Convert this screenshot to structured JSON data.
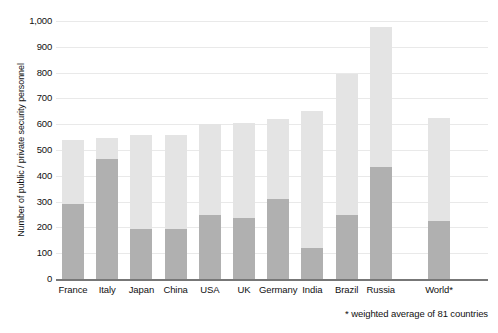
{
  "chart_data": {
    "type": "bar",
    "subtype": "stacked-bar",
    "title": "",
    "xlabel": "",
    "ylabel": "Number of public / private security personnel",
    "ylim": [
      0,
      1000
    ],
    "yticks": [
      0,
      100,
      200,
      300,
      400,
      500,
      600,
      700,
      800,
      900,
      1000
    ],
    "ytick_labels": [
      "0",
      "100",
      "200",
      "300",
      "400",
      "500",
      "600",
      "700",
      "800",
      "900",
      "1,000"
    ],
    "grid": true,
    "legend": "none",
    "categories": [
      "France",
      "Italy",
      "Japan",
      "China",
      "USA",
      "UK",
      "Germany",
      "India",
      "Brazil",
      "Russia",
      "World*"
    ],
    "series": [
      {
        "name": "public security personnel",
        "color": "#b0b0b0",
        "values": [
          290,
          465,
          195,
          195,
          250,
          235,
          310,
          120,
          250,
          435,
          225
        ]
      },
      {
        "name": "private security personnel",
        "color": "#e4e4e4",
        "values": [
          250,
          80,
          365,
          365,
          350,
          370,
          310,
          530,
          545,
          540,
          400
        ]
      }
    ],
    "totals": [
      540,
      545,
      560,
      560,
      600,
      605,
      620,
      650,
      795,
      975,
      625
    ],
    "annotations": [
      "* weighted average of 81 countries"
    ]
  },
  "axis": {
    "y_title": "Number of public / private security personnel",
    "y_ticks": [
      {
        "label": "1,000",
        "value": 1000
      },
      {
        "label": "900",
        "value": 900
      },
      {
        "label": "800",
        "value": 800
      },
      {
        "label": "700",
        "value": 700
      },
      {
        "label": "600",
        "value": 600
      },
      {
        "label": "500",
        "value": 500
      },
      {
        "label": "400",
        "value": 400
      },
      {
        "label": "300",
        "value": 300
      },
      {
        "label": "200",
        "value": 200
      },
      {
        "label": "100",
        "value": 100
      },
      {
        "label": "0",
        "value": 0
      }
    ]
  },
  "bars": [
    {
      "label": "France",
      "total": 540,
      "public": 290,
      "private": 250
    },
    {
      "label": "Italy",
      "total": 545,
      "public": 465,
      "private": 80
    },
    {
      "label": "Japan",
      "total": 560,
      "public": 195,
      "private": 365
    },
    {
      "label": "China",
      "total": 560,
      "public": 195,
      "private": 365
    },
    {
      "label": "USA",
      "total": 600,
      "public": 250,
      "private": 350
    },
    {
      "label": "UK",
      "total": 605,
      "public": 235,
      "private": 370
    },
    {
      "label": "Germany",
      "total": 620,
      "public": 310,
      "private": 310
    },
    {
      "label": "India",
      "total": 650,
      "public": 120,
      "private": 530
    },
    {
      "label": "Brazil",
      "total": 795,
      "public": 250,
      "private": 545
    },
    {
      "label": "Russia",
      "total": 975,
      "public": 435,
      "private": 540
    },
    {
      "label": "World*",
      "total": 625,
      "public": 225,
      "private": 400
    }
  ],
  "footnote": "* weighted average of 81 countries",
  "colors": {
    "public": "#b0b0b0",
    "private": "#e4e4e4",
    "grid": "#e9e9e9",
    "axis": "#777777",
    "text": "#111111",
    "background": "#ffffff"
  }
}
